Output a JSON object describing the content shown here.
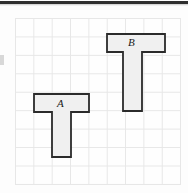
{
  "figure": {
    "title": "",
    "background_color": "#fdfdfd",
    "grid": {
      "columns": 9,
      "rows": 9,
      "cell_size_px": 18.4,
      "line_color": "#e7e7e7",
      "origin_x": 15,
      "origin_y": 18
    },
    "rule": {
      "color": "#2e2e2e"
    },
    "shapes": [
      {
        "id": "shape-a",
        "label": "A",
        "type": "tee-polygon",
        "fill_color": "#f0f0f0",
        "stroke_color": "#2b2b2b",
        "points": "34,94 89,94 89,112 71,112 71,157 52,157 52,112 34,112",
        "label_x": 57,
        "label_y": 98
      },
      {
        "id": "shape-b",
        "label": "B",
        "type": "tee-polygon",
        "fill_color": "#f0f0f0",
        "stroke_color": "#2b2b2b",
        "points": "107,34 165,34 165,52 142,52 142,111 123,111 123,52 107,52",
        "label_x": 128,
        "label_y": 37
      }
    ]
  }
}
